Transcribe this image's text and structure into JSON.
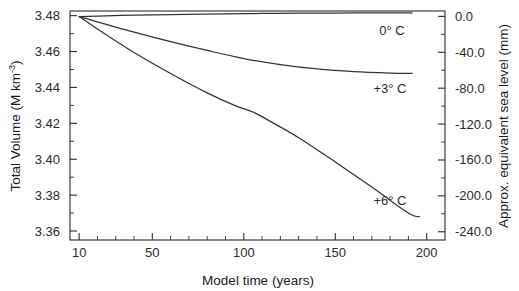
{
  "chart_data": {
    "type": "line",
    "title": "",
    "subtitle": "",
    "xlabel": "Model time (years)",
    "ylabel": "Total Volume (M km",
    "ylabel_sup": "-3",
    "ylabel_suffix": ")",
    "ylabel_full": "Total Volume (M km^-3)",
    "y2label": "Approx. equivalent sea level (mm)",
    "xlim": [
      5,
      210
    ],
    "ylim": [
      3.355,
      3.4826
    ],
    "y2lim": [
      -249.2,
      6.0
    ],
    "grid": false,
    "legend_position": "inline-right-of-curve-ends",
    "xticks": [
      10,
      50,
      100,
      150,
      200
    ],
    "xticklabels": [
      "10",
      "50",
      "100",
      "150",
      "200"
    ],
    "xminor_step": 10,
    "yticks": [
      3.36,
      3.38,
      3.4,
      3.42,
      3.44,
      3.46,
      3.48
    ],
    "yticklabels": [
      "3.36",
      "3.38",
      "3.40",
      "3.42",
      "3.44",
      "3.46",
      "3.48"
    ],
    "y2ticks": [
      0.0,
      -40.0,
      -80.0,
      -120.0,
      -160.0,
      -200.0,
      -240.0
    ],
    "y2ticklabels": [
      "0.0",
      "-40.0",
      "-80.0",
      "-120.0",
      "-160.0",
      "-200.0",
      "-240.0"
    ],
    "y2minor_step": 20,
    "series": [
      {
        "name": "0° C",
        "label": "0° C",
        "color": "#333333",
        "x": [
          10,
          20,
          40,
          60,
          80,
          100,
          120,
          140,
          160,
          180,
          192
        ],
        "values": [
          3.4795,
          3.4798,
          3.4803,
          3.4806,
          3.4809,
          3.4811,
          3.4813,
          3.4814,
          3.4815,
          3.4816,
          3.4816
        ]
      },
      {
        "name": "+3° C",
        "label": "+3° C",
        "color": "#333333",
        "x": [
          10,
          20,
          40,
          60,
          80,
          100,
          120,
          140,
          160,
          180,
          192
        ],
        "values": [
          3.4795,
          3.4765,
          3.4708,
          3.4655,
          3.4606,
          3.4561,
          3.4527,
          3.4503,
          3.4488,
          3.448,
          3.4478
        ]
      },
      {
        "name": "+6° C",
        "label": "+6° C",
        "color": "#333333",
        "x": [
          10,
          20,
          40,
          60,
          80,
          95,
          105,
          115,
          130,
          150,
          170,
          190,
          196
        ],
        "values": [
          3.4795,
          3.4726,
          3.4595,
          3.4478,
          3.437,
          3.43,
          3.4263,
          3.4208,
          3.412,
          3.3985,
          3.3845,
          3.37,
          3.368
        ]
      }
    ],
    "annotations": [
      {
        "text": "0° C",
        "x_px": 392,
        "y_px": 35
      },
      {
        "text": "+3° C",
        "x_px": 390,
        "y_px": 93
      },
      {
        "text": "+6° C",
        "x_px": 390,
        "y_px": 205
      }
    ]
  }
}
